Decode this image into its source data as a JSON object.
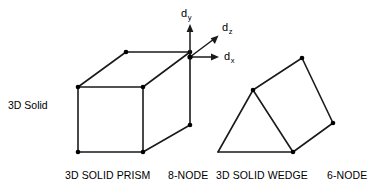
{
  "figure": {
    "side_label": "3D Solid",
    "background_color": "#ffffff",
    "stroke_color": "#000000",
    "node_color": "#000000"
  },
  "axes": {
    "origin": [
      190,
      57
    ],
    "items": [
      {
        "name": "d_y",
        "letter": "d",
        "sub": "y",
        "label_x": 181,
        "label_y": 8,
        "tip": [
          190,
          27
        ],
        "direction": "up"
      },
      {
        "name": "d_z",
        "letter": "d",
        "sub": "z",
        "label_x": 222,
        "label_y": 22,
        "tip": [
          213,
          38
        ],
        "direction": "up-right-diagonal"
      },
      {
        "name": "d_x",
        "letter": "d",
        "sub": "x",
        "label_x": 224,
        "label_y": 52,
        "tip": [
          215,
          57
        ],
        "direction": "right"
      }
    ]
  },
  "shapes": {
    "prism": {
      "name": "3D Solid Prism hexahedron",
      "node_count": 8,
      "vertices": [
        [
          78,
          87
        ],
        [
          143,
          87
        ],
        [
          143,
          152
        ],
        [
          78,
          152
        ],
        [
          126,
          52
        ],
        [
          190,
          52
        ],
        [
          190,
          125
        ],
        [
          126,
          117
        ]
      ],
      "edges": [
        [
          0,
          1
        ],
        [
          1,
          2
        ],
        [
          2,
          3
        ],
        [
          3,
          0
        ],
        [
          4,
          5
        ],
        [
          5,
          6
        ],
        [
          6,
          2
        ],
        [
          2,
          1
        ],
        [
          1,
          5
        ],
        [
          0,
          4
        ],
        [
          4,
          5
        ]
      ],
      "caption_main": "3D SOLID PRISM",
      "caption_nodes": "8-NODE"
    },
    "wedge": {
      "name": "3D Solid Wedge triangular prism",
      "node_count": 6,
      "vertices": [
        [
          218,
          152
        ],
        [
          293,
          152
        ],
        [
          253,
          90
        ],
        [
          302,
          58
        ],
        [
          333,
          123
        ]
      ],
      "caption_main": "3D SOLID WEDGE",
      "caption_nodes": "6-NODE"
    }
  },
  "captions": [
    {
      "id": "prism-main",
      "text": "3D SOLID PRISM",
      "x": 65,
      "y": 170
    },
    {
      "id": "prism-nodes",
      "text": "8-NODE",
      "x": 168,
      "y": 170
    },
    {
      "id": "wedge-main",
      "text": "3D SOLID WEDGE",
      "x": 216,
      "y": 170
    },
    {
      "id": "wedge-nodes",
      "text": "6-NODE",
      "x": 327,
      "y": 170
    }
  ],
  "side_label_pos": {
    "x": 8,
    "y": 100
  }
}
